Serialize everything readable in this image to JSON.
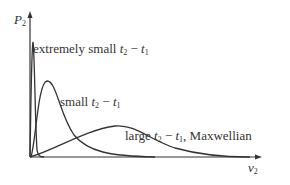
{
  "axes": {
    "y_label": {
      "base": "P",
      "sub": "2"
    },
    "x_label": {
      "base": "v",
      "sub": "2"
    }
  },
  "curves": [
    {
      "label_prefix": "extremely small ",
      "t_a": "t",
      "t_a_sub": "2",
      "minus": " − ",
      "t_b": "t",
      "t_b_sub": "1",
      "label_suffix": ""
    },
    {
      "label_prefix": "small ",
      "t_a": "t",
      "t_a_sub": "2",
      "minus": " − ",
      "t_b": "t",
      "t_b_sub": "1",
      "label_suffix": ""
    },
    {
      "label_prefix": "large ",
      "t_a": "t",
      "t_a_sub": "2",
      "minus": " − ",
      "t_b": "t",
      "t_b_sub": "1",
      "label_suffix": ", Maxwellian"
    }
  ],
  "colors": {
    "line": "#333333",
    "text": "#333333",
    "background": "#ffffff"
  }
}
